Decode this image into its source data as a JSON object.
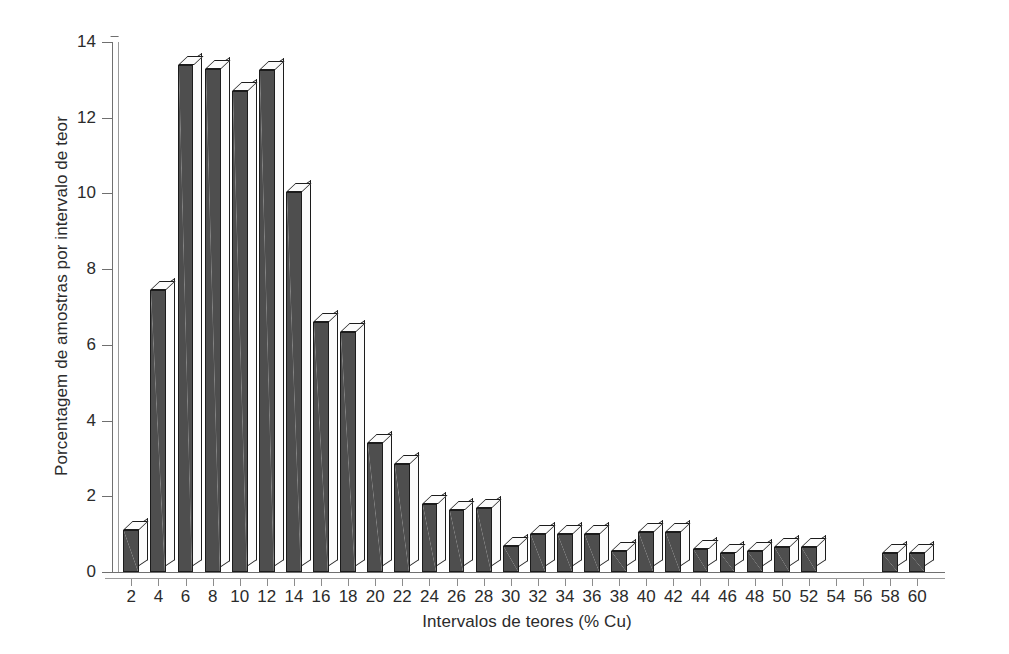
{
  "chart_data": {
    "type": "bar",
    "title": "",
    "subtitle": "",
    "xlabel": "Intervalos de teores (% Cu)",
    "ylabel": "Porcentagem de amostras por intervalo de teor",
    "categories": [
      "2",
      "4",
      "6",
      "8",
      "10",
      "12",
      "14",
      "16",
      "18",
      "20",
      "22",
      "24",
      "26",
      "28",
      "30",
      "32",
      "34",
      "36",
      "38",
      "40",
      "42",
      "44",
      "46",
      "48",
      "50",
      "52",
      "54",
      "56",
      "58",
      "60"
    ],
    "values": [
      1.1,
      7.45,
      13.4,
      13.3,
      12.7,
      13.25,
      10.05,
      6.6,
      6.35,
      3.4,
      2.85,
      1.8,
      1.65,
      1.7,
      0.7,
      1.0,
      1.0,
      1.0,
      0.55,
      1.05,
      1.05,
      0.6,
      0.5,
      0.55,
      0.65,
      0.65,
      0.0,
      0.0,
      0.5,
      0.5
    ],
    "xlim": [
      0,
      30
    ],
    "ylim": [
      0,
      14
    ],
    "ytick_values": [
      0,
      2,
      4,
      6,
      8,
      10,
      12,
      14
    ],
    "ytick_labels": [
      "0",
      "2",
      "4",
      "6",
      "8",
      "10",
      "12",
      "14"
    ],
    "grid": false,
    "legend": null,
    "bar_style": "3d-block",
    "colors": {
      "bar_front": "#4e4e4e",
      "bar_top": "#fbfbfb",
      "bar_side": "#fbfbfb",
      "bar_outline": "#1c1c1c",
      "axis": "#6f6f6f",
      "text": "#2b2b2b",
      "background": "#ffffff"
    }
  }
}
